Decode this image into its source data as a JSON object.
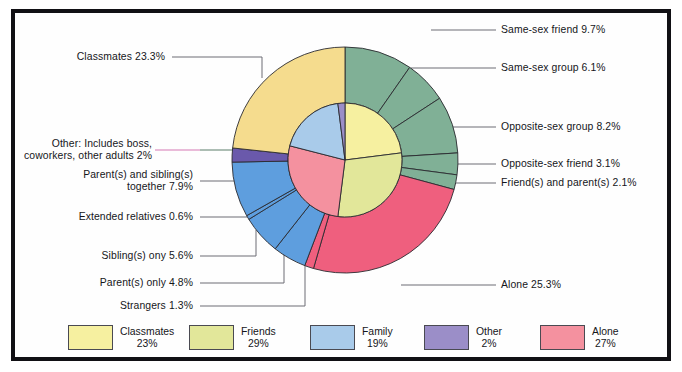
{
  "chart_data": {
    "type": "pie",
    "title": "",
    "subtitle": "",
    "xlabel": "",
    "ylabel": "",
    "legend_position": "bottom",
    "grid": false,
    "rings": [
      {
        "name": "inner",
        "radius_ratio": 0.5,
        "categories": [
          "Classmates",
          "Friends",
          "Alone",
          "Family",
          "Other"
        ],
        "values": [
          23,
          29,
          27,
          19,
          2
        ],
        "colors": [
          "#f6f0a0",
          "#e2e79a",
          "#f4919f",
          "#a9cbea",
          "#9b8ec8"
        ]
      },
      {
        "name": "outer",
        "radius_ratio": 1.0,
        "categories": [
          "Same-sex friend",
          "Same-sex group",
          "Opposite-sex group",
          "Opposite-sex friend",
          "Friend(s) and parent(s)",
          "Alone",
          "Strangers",
          "Parent(s) only",
          "Sibling(s) ony",
          "Extended relatives",
          "Parent(s) and sibling(s) together",
          "Other: Includes boss, coworkers, other adults",
          "Classmates"
        ],
        "values": [
          9.7,
          6.1,
          8.2,
          3.1,
          2.1,
          25.3,
          1.3,
          4.8,
          5.6,
          0.6,
          7.9,
          2.0,
          23.3
        ],
        "colors": [
          "#80b096",
          "#80b096",
          "#80b096",
          "#80b096",
          "#80b096",
          "#ef5f7e",
          "#ef5f7e",
          "#5e9ede",
          "#5e9ede",
          "#5e9ede",
          "#5e9ede",
          "#6a59ab",
          "#f5dc8e"
        ]
      }
    ]
  },
  "labels": {
    "right": [
      {
        "text": "Same-sex friend 9.7%"
      },
      {
        "text": "Same-sex group 6.1%"
      },
      {
        "text": "Opposite-sex group 8.2%"
      },
      {
        "text": "Opposite-sex friend 3.1%"
      },
      {
        "text": "Friend(s) and parent(s) 2.1%"
      },
      {
        "text": "Alone 25.3%"
      }
    ],
    "left": [
      {
        "text": "Classmates 23.3%"
      },
      {
        "line1": "Other: Includes boss,",
        "line2": "coworkers, other adults 2%"
      },
      {
        "line1": "Parent(s) and sibling(s)",
        "line2": "together 7.9%"
      },
      {
        "text": "Extended relatives 0.6%"
      },
      {
        "text": "Sibling(s) ony 5.6%"
      },
      {
        "text": "Parent(s) only 4.8%"
      },
      {
        "text": "Strangers 1.3%"
      }
    ]
  },
  "legend": {
    "items": [
      {
        "label": "Classmates",
        "pct": "23%",
        "color": "#f6f0a0"
      },
      {
        "label": "Friends",
        "pct": "29%",
        "color": "#e2e79a"
      },
      {
        "label": "Family",
        "pct": "19%",
        "color": "#a9cbea"
      },
      {
        "label": "Other",
        "pct": "2%",
        "color": "#9b8ec8"
      },
      {
        "label": "Alone",
        "pct": "27%",
        "color": "#f4919f"
      }
    ]
  },
  "colors": {
    "frame": "#111014",
    "background": "#fefefe",
    "leader": "#6d6d75",
    "wedge_stroke": "#2a2a30"
  }
}
